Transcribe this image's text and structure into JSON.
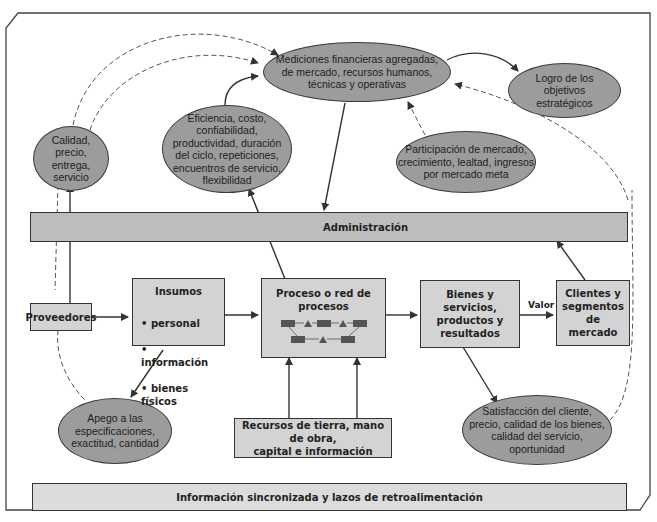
{
  "diagram": {
    "ellipses": {
      "mediciones": "Mediciones financieras agregadas,\nde mercado, recursos humanos,\ntécnicas y operativas",
      "logro": "Logro de los\nobjetivos\nestratégicos",
      "calidad": "Calidad,\nprecio,\nentrega,\nservicio",
      "eficiencia": "Eficiencia, costo,\nconfiabilidad,\nproductividad, duración\ndel ciclo, repeticiones,\nencuentros de servicio,\nflexibilidad",
      "participacion": "Participación de mercado,\ncrecimiento, lealtad, ingresos\npor mercado meta",
      "apego": "Apego a las\nespecificaciones,\nexactitud, cantidad",
      "satisfaccion": "Satisfacción del cliente,\nprecio, calidad de los bienes,\ncalidad del servicio,\noportunidad"
    },
    "bars": {
      "administracion": "Administración",
      "informacion": "Información sincronizada y lazos de retroalimentación"
    },
    "boxes": {
      "proveedores": "Proveedores",
      "insumos_title": "Insumos",
      "insumos_items": [
        "personal",
        "información",
        "bienes físicos"
      ],
      "proceso": "Proceso o red de\nprocesos",
      "bienes": "Bienes y\nservicios,\nproductos y\nresultados",
      "clientes": "Clientes y\nsegmentos de\nmercado",
      "recursos": "Recursos de tierra, mano de obra,\ncapital e información"
    },
    "edge_labels": {
      "valor": "Valor"
    },
    "colors": {
      "ellipse_fill": "#9c9c9c",
      "box_fill": "#d3d3d3",
      "bar_fill": "#bdbdbd",
      "line": "#333333"
    }
  }
}
